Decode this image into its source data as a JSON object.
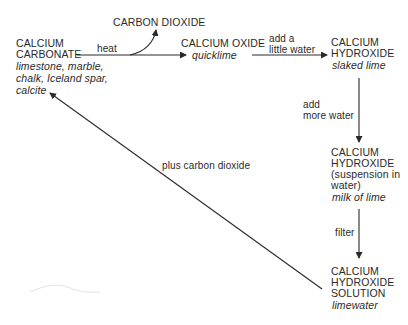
{
  "diagram": {
    "nodes": {
      "carbon_dioxide": {
        "name": "CARBON DIOXIDE"
      },
      "calcium_carbonate": {
        "name_line1": "CALCIUM",
        "name_line2": "CARBONATE",
        "common_line1": "limestone, marble,",
        "common_line2": "chalk, Iceland spar,",
        "common_line3": "calcite"
      },
      "calcium_oxide": {
        "name": "CALCIUM OXIDE",
        "common": "quicklime"
      },
      "calcium_hydroxide": {
        "name_line1": "CALCIUM",
        "name_line2": "HYDROXIDE",
        "common": "slaked lime"
      },
      "calcium_hydroxide_suspension": {
        "name_line1": "CALCIUM",
        "name_line2": "HYDROXIDE",
        "name_line3": "(suspension in",
        "name_line4": "water)",
        "common": "milk of lime"
      },
      "calcium_hydroxide_solution": {
        "name_line1": "CALCIUM",
        "name_line2": "HYDROXIDE",
        "name_line3": "SOLUTION",
        "common": "limewater"
      }
    },
    "edges": {
      "heat": {
        "label": "heat"
      },
      "add_little_water": {
        "label_line1": "add a",
        "label_line2": "little water"
      },
      "add_more_water": {
        "label_line1": "add",
        "label_line2": "more water"
      },
      "filter": {
        "label": "filter"
      },
      "plus_co2": {
        "label": "plus carbon dioxide"
      }
    },
    "colors": {
      "line": "#2a2a2a",
      "text": "#2a2a2a",
      "background": "#ffffff"
    }
  }
}
